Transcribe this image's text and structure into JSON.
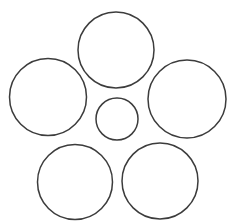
{
  "figure": {
    "canvas": {
      "width": 243,
      "height": 223,
      "background_color": "#ffffff"
    },
    "style": {
      "stroke_color": "#3c3c3c",
      "stroke_width": 1.5,
      "fill_color": "none"
    },
    "shape_count": 6
  },
  "chart_data": {
    "type": "scatter",
    "xlabel": "",
    "ylabel": "",
    "xlim": [
      0,
      243
    ],
    "ylim": [
      0,
      223
    ],
    "grid": false,
    "legend": "none",
    "shapes": [
      {
        "name": "top-circle",
        "position": "top",
        "cx": 116,
        "cy": 50,
        "r": 38,
        "diameter": 76,
        "size_class": "large"
      },
      {
        "name": "left-circle",
        "position": "upper-left",
        "cx": 48,
        "cy": 97,
        "r": 38.5,
        "diameter": 77,
        "size_class": "large"
      },
      {
        "name": "right-circle",
        "position": "upper-right",
        "cx": 187,
        "cy": 99,
        "r": 39,
        "diameter": 78,
        "size_class": "large"
      },
      {
        "name": "center-circle",
        "position": "center",
        "cx": 117,
        "cy": 119,
        "r": 21,
        "diameter": 42,
        "size_class": "small"
      },
      {
        "name": "bottom-left-circle",
        "position": "bottom-left",
        "cx": 75,
        "cy": 182,
        "r": 37.5,
        "diameter": 75,
        "size_class": "large"
      },
      {
        "name": "bottom-right-circle",
        "position": "bottom-right",
        "cx": 160,
        "cy": 181,
        "r": 38,
        "diameter": 76,
        "size_class": "large"
      }
    ]
  }
}
